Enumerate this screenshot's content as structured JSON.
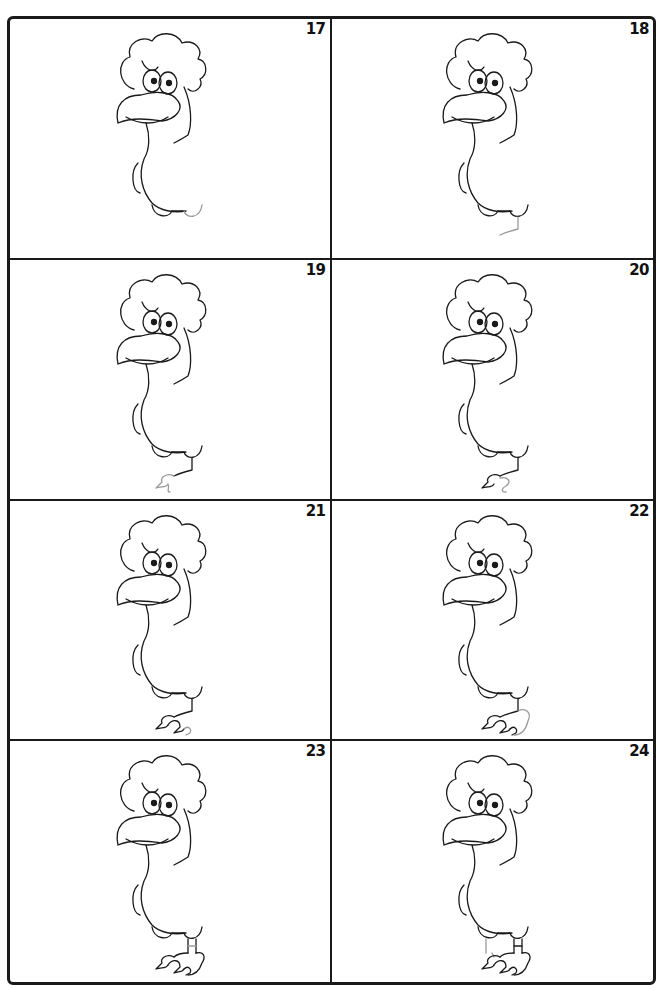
{
  "page": {
    "panels": [
      {
        "number": "17",
        "step": "Draw the leg bumps",
        "new_part": "right bump",
        "has_leg": false,
        "has_foot": false
      },
      {
        "number": "18",
        "step": "Start the leg",
        "new_part": "leg line",
        "has_leg": true,
        "has_foot": false
      },
      {
        "number": "19",
        "step": "Begin the foot",
        "new_part": "toe outline",
        "has_leg": true,
        "has_foot": true
      },
      {
        "number": "20",
        "step": "Add a toe",
        "new_part": "toe",
        "has_leg": true,
        "has_foot": true
      },
      {
        "number": "21",
        "step": "Add another toe",
        "new_part": "toe",
        "has_leg": true,
        "has_foot": true
      },
      {
        "number": "22",
        "step": "Finish the foot",
        "new_part": "heel",
        "has_leg": true,
        "has_foot": true
      },
      {
        "number": "23",
        "step": "Thicken the leg",
        "new_part": "leg band",
        "has_leg": true,
        "has_foot": true
      },
      {
        "number": "24",
        "step": "Draw the back leg",
        "new_part": "back leg",
        "has_leg": true,
        "has_foot": true
      }
    ]
  },
  "colors": {
    "line": "#1a1a1a",
    "new_stroke": "#9a9a9a",
    "background": "#ffffff"
  }
}
